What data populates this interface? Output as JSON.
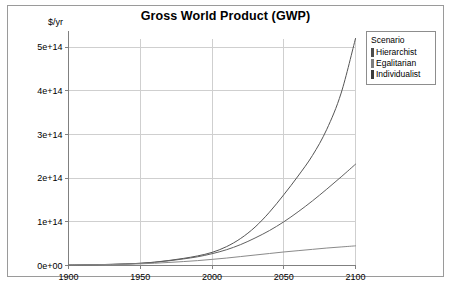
{
  "chart_data": {
    "type": "line",
    "title": "Gross World Product (GWP)",
    "ylabel": "$/yr",
    "xlabel": "",
    "xlim": [
      1900,
      2100
    ],
    "ylim": [
      0,
      520000000000000
    ],
    "grid": true,
    "legend_position": "top-right-outside",
    "legend_title": "Scenario",
    "x_ticks": [
      "1900",
      "1950",
      "2000",
      "2050",
      "2100"
    ],
    "x_tick_values": [
      1900,
      1950,
      2000,
      2050,
      2100
    ],
    "y_ticks": [
      "0e+00",
      "1e+14",
      "2e+14",
      "3e+14",
      "4e+14",
      "5e+14"
    ],
    "y_tick_values": [
      0,
      100000000000000,
      200000000000000,
      300000000000000,
      400000000000000,
      500000000000000
    ],
    "x": [
      1900,
      1910,
      1920,
      1930,
      1940,
      1950,
      1960,
      1970,
      1980,
      1990,
      2000,
      2010,
      2020,
      2030,
      2040,
      2050,
      2060,
      2070,
      2080,
      2090,
      2100
    ],
    "series": [
      {
        "name": "Hierarchist",
        "color": "#555555",
        "values": [
          1000000000000.0,
          1400000000000.0,
          1900000000000.0,
          2600000000000.0,
          3600000000000.0,
          5000000000000.0,
          7600000000000.0,
          11500000000000.0,
          16200000000000.0,
          22000000000000.0,
          30000000000000.0,
          43000000000000.0,
          62000000000000.0,
          88000000000000.0,
          122000000000000.0,
          162000000000000.0,
          205000000000000.0,
          252000000000000.0,
          312000000000000.0,
          395000000000000.0,
          520000000000000.0
        ]
      },
      {
        "name": "Egalitarian",
        "color": "#606060",
        "values": [
          1000000000000.0,
          1400000000000.0,
          1900000000000.0,
          2600000000000.0,
          3600000000000.0,
          5000000000000.0,
          7400000000000.0,
          10800000000000.0,
          15000000000000.0,
          20000000000000.0,
          27000000000000.0,
          36000000000000.0,
          48000000000000.0,
          63000000000000.0,
          80000000000000.0,
          100000000000000.0,
          123000000000000.0,
          148000000000000.0,
          175000000000000.0,
          203000000000000.0,
          232000000000000.0
        ]
      },
      {
        "name": "Individualist",
        "color": "#8a8a8a",
        "values": [
          1000000000000.0,
          1300000000000.0,
          1700000000000.0,
          2200000000000.0,
          2900000000000.0,
          3800000000000.0,
          5200000000000.0,
          7000000000000.0,
          9000000000000.0,
          11200000000000.0,
          14000000000000.0,
          17000000000000.0,
          20500000000000.0,
          24000000000000.0,
          27500000000000.0,
          31000000000000.0,
          34000000000000.0,
          37000000000000.0,
          40000000000000.0,
          42500000000000.0,
          45000000000000.0
        ]
      }
    ]
  },
  "legend": {
    "title": "Scenario",
    "entries": [
      {
        "label": "Hierarchist",
        "color": "#4d4d4d"
      },
      {
        "label": "Egalitarian",
        "color": "#7d7d7d"
      },
      {
        "label": "Individualist",
        "color": "#3b3b3b"
      }
    ]
  },
  "colors": {
    "frame": "#9a9a9a",
    "grid": "#cfcfcf",
    "axis": "#808080",
    "background": "#ffffff",
    "text": "#000000"
  }
}
